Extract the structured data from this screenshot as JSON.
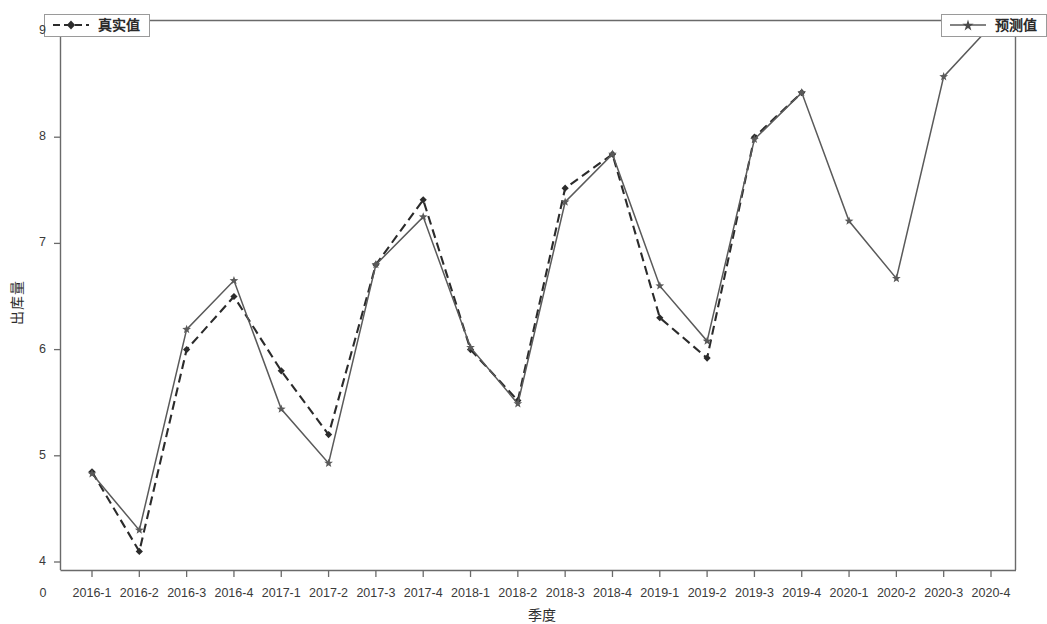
{
  "chart_data": {
    "type": "line",
    "title": "",
    "xlabel": "季度",
    "ylabel": "出库量",
    "categories": [
      "2016-1",
      "2016-2",
      "2016-3",
      "2016-4",
      "2017-1",
      "2017-2",
      "2017-3",
      "2017-4",
      "2018-1",
      "2018-2",
      "2018-3",
      "2018-4",
      "2019-1",
      "2019-2",
      "2019-3",
      "2019-4",
      "2020-1",
      "2020-2",
      "2020-3",
      "2020-4"
    ],
    "series": [
      {
        "name": "真实值",
        "style": "dashed",
        "marker": "diamond",
        "color": "#2b2b2b",
        "values": [
          4.85,
          4.1,
          6.0,
          6.5,
          5.8,
          5.2,
          6.8,
          7.41,
          6.0,
          5.52,
          7.52,
          7.84,
          6.3,
          5.92,
          8.0,
          8.42,
          null,
          null,
          null,
          null
        ]
      },
      {
        "name": "预测值",
        "style": "solid",
        "marker": "star",
        "color": "#5a5a5a",
        "values": [
          4.83,
          4.3,
          6.19,
          6.65,
          5.44,
          4.93,
          6.8,
          7.25,
          6.02,
          5.49,
          7.39,
          7.84,
          6.6,
          6.08,
          7.98,
          8.42,
          7.21,
          6.67,
          8.57,
          9.05
        ]
      }
    ],
    "yticks": [
      "4",
      "5",
      "6",
      "7",
      "8",
      "9"
    ],
    "ytick_values": [
      4,
      5,
      6,
      7,
      8,
      9
    ],
    "ylim": [
      3.84,
      9.17
    ],
    "origin_label": "0",
    "grid": false,
    "legend_position": "top-left and top-right",
    "axis_color": "#6a6a6a",
    "background": "#ffffff"
  },
  "legend": {
    "true_label": "真实值",
    "pred_label": "预测值"
  }
}
